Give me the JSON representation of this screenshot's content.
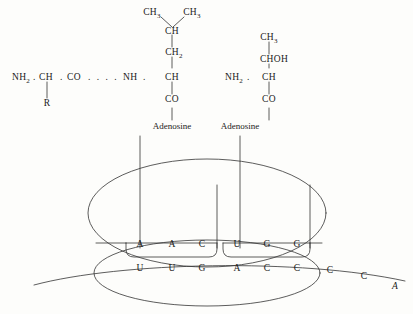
{
  "diagram": {
    "ink_color": "#1a1a1a",
    "background_color": "#fdfdfb"
  },
  "peptide_chain": {
    "backbone_prefix": {
      "nh2": "NH",
      "nh2_sub": "2",
      "dot1": ".",
      "ch": "CH",
      "dot2": ".",
      "co": "CO",
      "ellipsis": ". . . .",
      "nh": "NH",
      "dot3": ".",
      "ch2": "CH"
    },
    "side_group_r": "R"
  },
  "leucine_residue": {
    "name": "leucine",
    "ch3_left": "CH",
    "ch3_left_sub": "3",
    "ch3_right": "CH",
    "ch3_right_sub": "3",
    "ch": "CH",
    "ch2": "CH",
    "ch2_sub": "2",
    "alpha_ch": "CH",
    "co": "CO",
    "adenosine": "Adenosine"
  },
  "threonine_residue": {
    "name": "threonine",
    "ch3": "CH",
    "ch3_sub": "3",
    "choh": "CHOH",
    "nh2": "NH",
    "nh2_sub": "2",
    "dot": ".",
    "alpha_ch": "CH",
    "co": "CO",
    "adenosine": "Adenosine"
  },
  "ribosome": {
    "large_subunit_label": "large-subunit",
    "small_subunit_label": "small-subunit"
  },
  "trna_left": {
    "anticodon_label": "anticodon",
    "bases": [
      {
        "base": "A",
        "x": 140
      },
      {
        "base": "A",
        "x": 172
      },
      {
        "base": "C",
        "x": 202
      }
    ]
  },
  "trna_right": {
    "anticodon_label": "anticodon",
    "bases": [
      {
        "base": "U",
        "x": 237
      },
      {
        "base": "G",
        "x": 267
      },
      {
        "base": "G",
        "x": 297
      }
    ]
  },
  "mrna": {
    "label": "messenger-rna",
    "bases": [
      {
        "base": "U",
        "x": 140,
        "italic": false
      },
      {
        "base": "U",
        "x": 172,
        "italic": false
      },
      {
        "base": "G",
        "x": 202,
        "italic": false
      },
      {
        "base": "A",
        "x": 237,
        "italic": false
      },
      {
        "base": "C",
        "x": 267,
        "italic": false
      },
      {
        "base": "C",
        "x": 297,
        "italic": false
      },
      {
        "base": "C",
        "x": 330,
        "italic": false
      },
      {
        "base": "C",
        "x": 364,
        "italic": false
      },
      {
        "base": "A",
        "x": 395,
        "italic": true
      }
    ]
  }
}
